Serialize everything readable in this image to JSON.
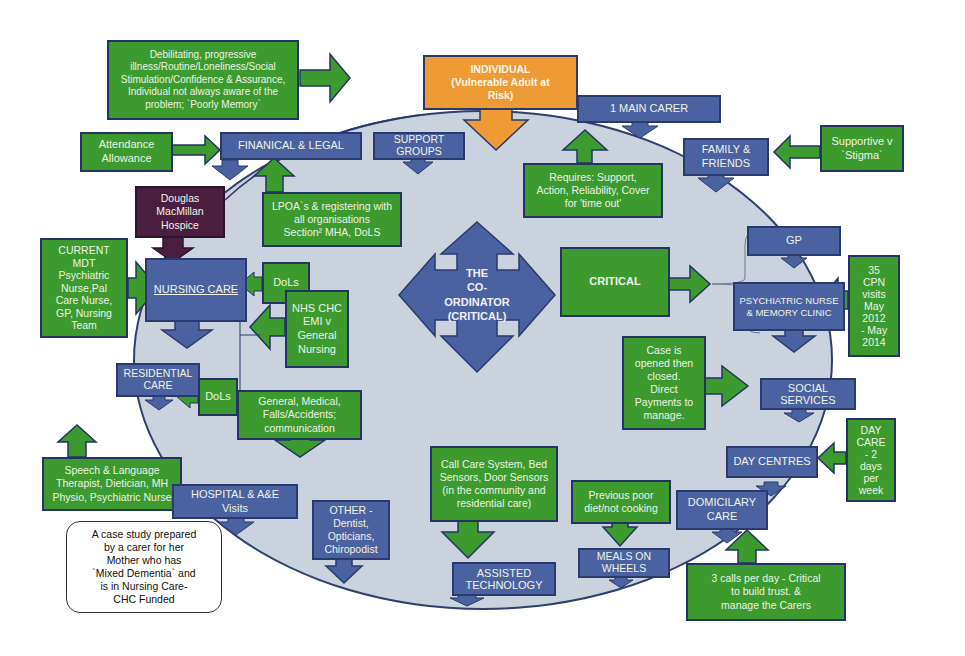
{
  "diagram": {
    "colors": {
      "green": "#3c9a2e",
      "blue": "#4b62a0",
      "orange": "#ee9a35",
      "purple": "#4b1d3f",
      "ellipse": "#c9d2dd",
      "border": "#233463"
    },
    "hub": {
      "label": "THE\nCO-\nORDINATOR\n(CRITICAL)"
    },
    "nodes": {
      "individual": "INDIVIDUAL\n(Vulnerable Adult at\nRisk)",
      "debilitating": "Debilitating, progressive\nillness/Routine/Loneliness/Social\nStimulation/Confidence & Assurance,\nIndividual not always aware of the\nproblem; `Poorly Memory`",
      "main_carer": "1 MAIN CARER",
      "requires": "Requires: Support,\nAction, Reliability, Cover\nfor 'time out'",
      "family_friends": "FAMILY &\nFRIENDS",
      "supportive": "Supportive v\n`Stigma`",
      "attendance": "Attendance\nAllowance",
      "financial_legal": "FINANICAL & LEGAL",
      "support_groups": "SUPPORT\nGROUPS",
      "lpoa": "LPOA`s & registering with\nall organisations\nSection² MHA, DoLS",
      "hospice": "Douglas\nMacMillan\nHospice",
      "current_mdt": "CURRENT\nMDT\nPsychiatric\nNurse,Pal\nCare Nurse,\nGP, Nursing\nTeam",
      "nursing_care": "NURSING CARE",
      "dols_1": "DoLs",
      "nhs_chc": "NHS CHC\nEMI v\nGeneral\nNursing",
      "residential_care": "RESIDENTIAL\nCARE",
      "dols_2": "DoLs",
      "general_medical": "General, Medical,\nFalls/Accidents;\ncommunication",
      "speech_language": "Speech & Language\nTherapist, Dietician, MH\nPhysio, Psychiatric Nurse",
      "hospital": "HOSPITAL & A&E\nVisits",
      "case_study": "A case study prepared\nby a carer for her\nMother who has\n`Mixed Dementia` and\nis in Nursing Care-\nCHC Funded",
      "other": "OTHER -\nDentist,\nOpticians,\nChiropodist",
      "call_care": "Call Care System, Bed\nSensors, Door Sensors\n(in the community and\nresidential care)",
      "assisted_tech": "ASSISTED\nTECHNOLOGY",
      "previous_poor": "Previous poor\ndiet/not cooking",
      "meals_on_wheels": "MEALS ON\nWHEELS",
      "domiciliary": "DOMICILARY\nCARE",
      "three_calls": "3 calls per day - Critical\nto build trust. &\nmanage the Carers",
      "day_centres": "DAY CENTRES",
      "day_care": "DAY\nCARE\n- 2\ndays\nper\nweek",
      "social_services": "SOCIAL\nSERVICES",
      "case_opened": "Case is\nopened then\nclosed.\nDirect\nPayments to\nmanage.",
      "critical": "CRITICAL",
      "gp": "GP",
      "psych_nurse": "PSYCHIATRIC NURSE\n& MEMORY CLINIC",
      "cpn_visits": "35\nCPN\nvisits\nMay\n2012\n- May\n2014"
    }
  }
}
